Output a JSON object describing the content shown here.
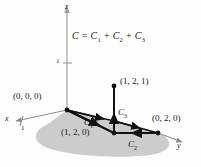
{
  "figure": {
    "title_equation": {
      "c": "C",
      "equals": " = ",
      "c1": "C",
      "c1_sub": "1",
      "plus1": " + ",
      "c2": "C",
      "c2_sub": "2",
      "plus2": " + ",
      "c3": "C",
      "c3_sub": "3"
    },
    "axes": {
      "z_label": "z",
      "x_label": "x",
      "y_label": "y",
      "z_tick_label": "1",
      "x_tick_label": "1"
    },
    "points": [
      {
        "name": "origin",
        "label": "(0, 0, 0)"
      },
      {
        "name": "apex",
        "label": "(1, 2, 1)"
      },
      {
        "name": "base",
        "label": "(1, 2, 0)"
      },
      {
        "name": "y-axis-point",
        "label": "(0, 2, 0)"
      }
    ],
    "curves": [
      {
        "name": "c1",
        "base": "C",
        "sub": "1"
      },
      {
        "name": "c2",
        "base": "C",
        "sub": "2"
      },
      {
        "name": "c3",
        "base": "C",
        "sub": "3"
      }
    ],
    "colors": {
      "plane_fill": "#c8c8c8",
      "line": "#111111",
      "axis": "#888888",
      "background": "#fdfdfc"
    }
  }
}
